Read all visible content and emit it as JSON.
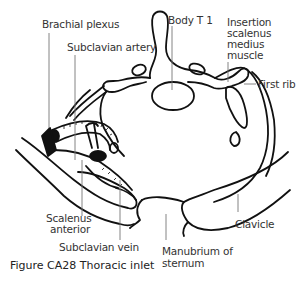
{
  "figure": {
    "caption": "Figure CA28  Thoracic inlet",
    "labels": {
      "brachial_plexus": "Brachial plexus",
      "subclavian_artery": "Subclavian artery",
      "body_t1": "Body T 1",
      "insertion_line1": "Insertion",
      "insertion_line2": "scalenus",
      "insertion_line3": "medius",
      "insertion_line4": "muscle",
      "first_rib": "First rib",
      "scalenus_line1": "Scalenus",
      "scalenus_line2": "anterior",
      "subclavian_vein": "Subclavian vein",
      "manubrium_line1": "Manubrium of",
      "manubrium_line2": "sternum",
      "clavicle": "Clavicle"
    },
    "colors": {
      "line": "#111111",
      "leader": "#777777",
      "text": "#333333",
      "background": "#ffffff"
    }
  }
}
